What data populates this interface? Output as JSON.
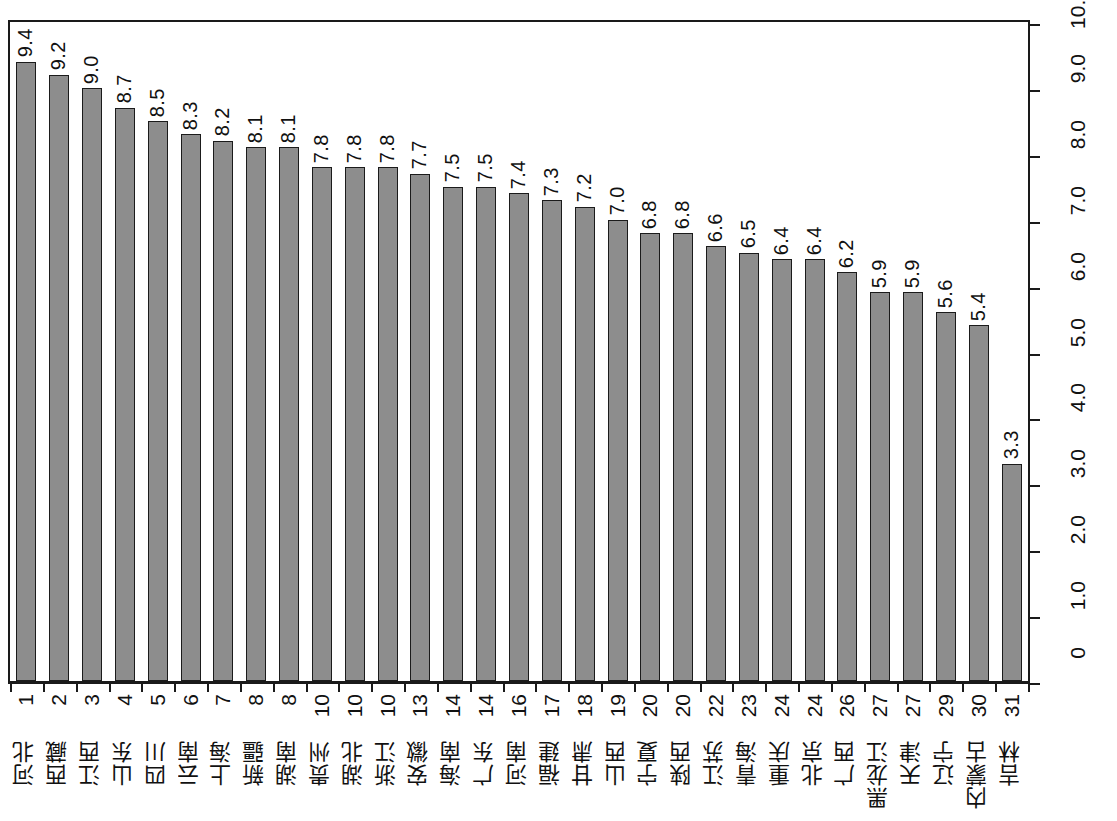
{
  "chart_data": {
    "type": "bar",
    "title": "",
    "subtitle": "",
    "xlabel": "",
    "ylabel": "",
    "ylim": [
      0,
      10.0
    ],
    "grid": false,
    "legend": null,
    "orientation": "vertical",
    "value_axis_position": "right",
    "value_axis_ticks": [
      "0",
      "1.0",
      "2.0",
      "3.0",
      "4.0",
      "5.0",
      "6.0",
      "7.0",
      "8.0",
      "9.0",
      "10.0"
    ],
    "value_axis_tick_values": [
      0,
      1.0,
      2.0,
      3.0,
      4.0,
      5.0,
      6.0,
      7.0,
      8.0,
      9.0,
      10.0
    ],
    "categories": [
      "河北",
      "西藏",
      "江西",
      "山东",
      "四川",
      "云南",
      "上海",
      "新疆",
      "湖南",
      "贵州",
      "湖北",
      "浙江",
      "安徽",
      "海南",
      "广东",
      "河南",
      "福建",
      "甘肃",
      "山西",
      "宁夏",
      "陕西",
      "江苏",
      "青海",
      "重庆",
      "北京",
      "广西",
      "黑龙江",
      "天津",
      "辽宁",
      "内蒙古",
      "吉林"
    ],
    "ranks": [
      "1",
      "2",
      "3",
      "4",
      "5",
      "6",
      "7",
      "8",
      "8",
      "10",
      "10",
      "10",
      "13",
      "14",
      "14",
      "16",
      "17",
      "18",
      "19",
      "20",
      "20",
      "22",
      "23",
      "24",
      "24",
      "26",
      "27",
      "27",
      "29",
      "30",
      "31"
    ],
    "values": [
      9.4,
      9.2,
      9.0,
      8.7,
      8.5,
      8.3,
      8.2,
      8.1,
      8.1,
      7.8,
      7.8,
      7.8,
      7.7,
      7.5,
      7.5,
      7.4,
      7.3,
      7.2,
      7.0,
      6.8,
      6.8,
      6.6,
      6.5,
      6.4,
      6.4,
      6.2,
      5.9,
      5.9,
      5.6,
      5.4,
      3.3
    ],
    "value_labels": [
      "9.4",
      "9.2",
      "9.0",
      "8.7",
      "8.5",
      "8.3",
      "8.2",
      "8.1",
      "8.1",
      "7.8",
      "7.8",
      "7.8",
      "7.7",
      "7.5",
      "7.5",
      "7.4",
      "7.3",
      "7.2",
      "7.0",
      "6.8",
      "6.8",
      "6.6",
      "6.5",
      "6.4",
      "6.4",
      "6.2",
      "5.9",
      "5.9",
      "5.6",
      "5.4",
      "3.3"
    ],
    "bar_color": "#8d8d8d",
    "bar_border_color": "#1b1b1b",
    "axis_color": "#1a1a1a",
    "background_color": "#ffffff"
  }
}
